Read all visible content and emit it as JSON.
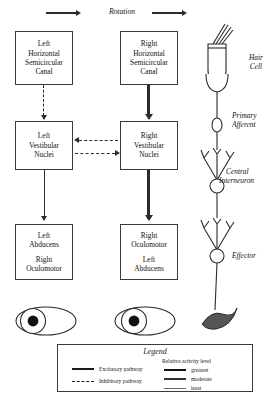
{
  "diagram": {
    "title_label": "Rotation",
    "boxes": {
      "left_canal": {
        "lines": [
          "Left",
          "Horizontal",
          "Semicircular",
          "Canal"
        ]
      },
      "right_canal": {
        "lines": [
          "Right",
          "Horizontal",
          "Semicircular",
          "Canal"
        ]
      },
      "left_nuclei": {
        "lines": [
          "Left",
          "Vestibular",
          "Nuclei"
        ]
      },
      "right_nuclei": {
        "lines": [
          "Right",
          "Vestibular",
          "Nuclei"
        ]
      },
      "left_motor": {
        "group_a": [
          "Left",
          "Abducens"
        ],
        "group_b": [
          "Right",
          "Oculomotor"
        ]
      },
      "right_motor": {
        "group_a": [
          "Right",
          "Oculomotor"
        ],
        "group_b": [
          "Left",
          "Abducens"
        ]
      }
    },
    "neuron_column": {
      "hair_cell": "Hair\nCell",
      "hair_cell_l1": "Hair",
      "hair_cell_l2": "Cell",
      "primary_afferent_l1": "Primary",
      "primary_afferent_l2": "Afferent",
      "interneuron_l1": "Central",
      "interneuron_l2": "Interneuron",
      "effector": "Effector"
    }
  },
  "legend": {
    "title": "Legend",
    "pathways": [
      {
        "label": "Excitatory pathway",
        "style": "solid"
      },
      {
        "label": "Inhibitory pathway",
        "style": "dashed"
      }
    ],
    "activity_heading": "Relative activity level",
    "activity_levels": [
      {
        "label": "greatest",
        "weight": "thick"
      },
      {
        "label": "moderate",
        "weight": "medium"
      },
      {
        "label": "least",
        "weight": "thin"
      }
    ]
  },
  "colors": {
    "ink": "#1a1a1a",
    "line": "#2b2b2b",
    "muscle": "#4a4a4a",
    "background": "#ffffff"
  }
}
